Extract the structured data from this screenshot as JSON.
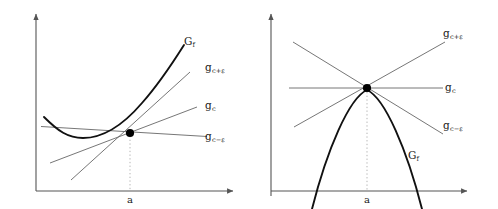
{
  "figure": {
    "panels": [
      {
        "id": "left",
        "curve_shape": "convex",
        "curve_label": "G",
        "curve_label_sub": "f",
        "point_label": "a",
        "lines": [
          {
            "name": "g-c-plus-eps",
            "base": "g",
            "sub": "c+ε"
          },
          {
            "name": "g-c",
            "base": "g",
            "sub": "c"
          },
          {
            "name": "g-c-minus-eps",
            "base": "g",
            "sub": "c−ε"
          }
        ]
      },
      {
        "id": "right",
        "curve_shape": "concave",
        "curve_label": "G",
        "curve_label_sub": "f",
        "point_label": "a",
        "lines": [
          {
            "name": "g-c-plus-eps",
            "base": "g",
            "sub": "c+ε"
          },
          {
            "name": "g-c",
            "base": "g",
            "sub": "c"
          },
          {
            "name": "g-c-minus-eps",
            "base": "g",
            "sub": "c−ε"
          }
        ]
      }
    ],
    "colors": {
      "background": "#ffffff",
      "axis": "#555555",
      "curve": "#111111",
      "line": "#666666",
      "point": "#000000",
      "dotted_guide": "#aaaaaa",
      "text": "#1a1a1a"
    }
  }
}
